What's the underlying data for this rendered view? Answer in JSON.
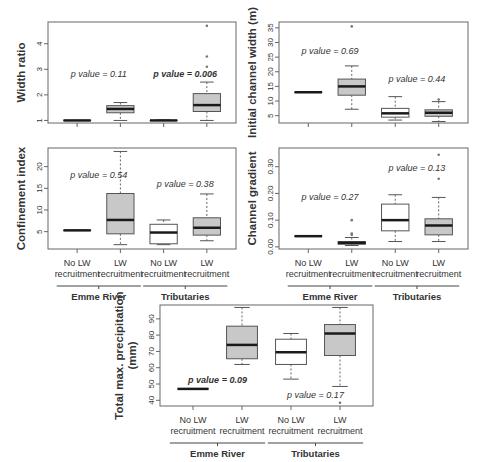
{
  "figure": {
    "group_labels": [
      "No LW\nrecruitment",
      "LW\nrecruitment",
      "No LW\nrecruitment",
      "LW\nrecruitment"
    ],
    "site_labels": [
      "Emme River",
      "Tributaries"
    ]
  },
  "chart_data": [
    {
      "type": "boxplot",
      "id": "width_ratio",
      "ylabel": "Width ratio",
      "yticks": [
        1,
        2,
        3,
        4
      ],
      "ylim": [
        0.9,
        4.85
      ],
      "categories": [
        "Emme River – No LW recruitment",
        "Emme River – LW recruitment",
        "Tributaries – No LW recruitment",
        "Tributaries – LW recruitment"
      ],
      "boxes": [
        {
          "min": 1.0,
          "q1": 1.0,
          "median": 1.0,
          "q3": 1.0,
          "max": 1.0,
          "fill": "#ffffff",
          "outliers": []
        },
        {
          "min": 1.0,
          "q1": 1.3,
          "median": 1.45,
          "q3": 1.58,
          "max": 1.7,
          "fill": "#c8c8c8",
          "outliers": []
        },
        {
          "min": 1.0,
          "q1": 1.0,
          "median": 1.0,
          "q3": 1.0,
          "max": 1.02,
          "fill": "#ffffff",
          "outliers": []
        },
        {
          "min": 1.0,
          "q1": 1.35,
          "median": 1.6,
          "q3": 2.05,
          "max": 2.5,
          "fill": "#c8c8c8",
          "outliers": [
            3.1,
            3.5,
            4.7
          ]
        }
      ],
      "annotations": [
        {
          "text": "p value = 0.11",
          "bold": false,
          "x_group": 1.5,
          "y": 2.7
        },
        {
          "text": "p value = 0.006",
          "bold": true,
          "x_group": 3.5,
          "y": 2.7
        }
      ]
    },
    {
      "type": "boxplot",
      "id": "initial_channel_width",
      "ylabel": "Initial channel width (m)",
      "yticks": [
        5,
        10,
        15,
        20,
        25,
        30,
        35
      ],
      "ylim": [
        2.5,
        37
      ],
      "categories": [
        "Emme River – No LW recruitment",
        "Emme River – LW recruitment",
        "Tributaries – No LW recruitment",
        "Tributaries – LW recruitment"
      ],
      "boxes": [
        {
          "min": 13,
          "q1": 13,
          "median": 13,
          "q3": 13,
          "max": 13,
          "fill": "#ffffff",
          "outliers": []
        },
        {
          "min": 7.2,
          "q1": 12,
          "median": 15,
          "q3": 17.5,
          "max": 22,
          "fill": "#c8c8c8",
          "outliers": [
            35.5
          ]
        },
        {
          "min": 3.5,
          "q1": 4.5,
          "median": 5.8,
          "q3": 7.5,
          "max": 11.5,
          "fill": "#ffffff",
          "outliers": []
        },
        {
          "min": 3.0,
          "q1": 4.8,
          "median": 6.0,
          "q3": 7.0,
          "max": 9.8,
          "fill": "#c8c8c8",
          "outliers": [
            10.5
          ]
        }
      ],
      "annotations": [
        {
          "text": "p value = 0.69",
          "bold": false,
          "x_group": 1.5,
          "y": 26.2
        },
        {
          "text": "p value = 0.44",
          "bold": false,
          "x_group": 3.5,
          "y": 16.5
        }
      ]
    },
    {
      "type": "boxplot",
      "id": "confinement_index",
      "ylabel": "Confinement index",
      "yticks": [
        5,
        10,
        15,
        20
      ],
      "ylim": [
        1.0,
        24.3
      ],
      "categories": [
        "Emme River – No LW recruitment",
        "Emme River – LW recruitment",
        "Tributaries – No LW recruitment",
        "Tributaries – LW recruitment"
      ],
      "boxes": [
        {
          "min": 5.3,
          "q1": 5.3,
          "median": 5.3,
          "q3": 5.3,
          "max": 5.3,
          "fill": "#ffffff",
          "outliers": []
        },
        {
          "min": 2.0,
          "q1": 4.5,
          "median": 7.7,
          "q3": 13.8,
          "max": 23.5,
          "fill": "#c8c8c8",
          "outliers": []
        },
        {
          "min": 2.0,
          "q1": 2.2,
          "median": 4.8,
          "q3": 6.7,
          "max": 7.7,
          "fill": "#ffffff",
          "outliers": []
        },
        {
          "min": 2.9,
          "q1": 4.2,
          "median": 5.9,
          "q3": 8.2,
          "max": 13.7,
          "fill": "#c8c8c8",
          "outliers": []
        }
      ],
      "annotations": [
        {
          "text": "p value = 0.54",
          "bold": false,
          "x_group": 1.5,
          "y": 17.4
        },
        {
          "text": "p value = 0.38",
          "bold": false,
          "x_group": 3.5,
          "y": 15.3
        }
      ]
    },
    {
      "type": "boxplot",
      "id": "channel_gradient",
      "ylabel": "Channel gradient",
      "yticks": [
        0.0,
        0.1,
        0.2,
        0.3
      ],
      "ytick_labels": [
        "0.00",
        "0.10",
        "0.20",
        "0.30"
      ],
      "ylim": [
        -0.008,
        0.37
      ],
      "categories": [
        "Emme River – No LW recruitment",
        "Emme River – LW recruitment",
        "Tributaries – No LW recruitment",
        "Tributaries – LW recruitment"
      ],
      "boxes": [
        {
          "min": 0.04,
          "q1": 0.04,
          "median": 0.04,
          "q3": 0.04,
          "max": 0.04,
          "fill": "#ffffff",
          "outliers": []
        },
        {
          "min": 0.005,
          "q1": 0.01,
          "median": 0.015,
          "q3": 0.02,
          "max": 0.035,
          "fill": "#c8c8c8",
          "outliers": [
            0.045,
            0.05,
            0.1
          ]
        },
        {
          "min": 0.02,
          "q1": 0.06,
          "median": 0.1,
          "q3": 0.16,
          "max": 0.195,
          "fill": "#ffffff",
          "outliers": []
        },
        {
          "min": 0.02,
          "q1": 0.045,
          "median": 0.08,
          "q3": 0.105,
          "max": 0.185,
          "fill": "#c8c8c8",
          "outliers": [
            0.255,
            0.345
          ]
        }
      ],
      "annotations": [
        {
          "text": "p value = 0.27",
          "bold": false,
          "x_group": 1.5,
          "y": 0.175
        },
        {
          "text": "p value = 0.13",
          "bold": false,
          "x_group": 3.5,
          "y": 0.285
        }
      ]
    },
    {
      "type": "boxplot",
      "id": "total_max_precipitation",
      "ylabel": "Total max. precipitation\n(mm)",
      "yticks": [
        40,
        50,
        60,
        70,
        80,
        90
      ],
      "ylim": [
        36.5,
        98.5
      ],
      "categories": [
        "Emme River – No LW recruitment",
        "Emme River – LW recruitment",
        "Tributaries – No LW recruitment",
        "Tributaries – LW recruitment"
      ],
      "boxes": [
        {
          "min": 47,
          "q1": 47,
          "median": 47,
          "q3": 47,
          "max": 47,
          "fill": "#ffffff",
          "outliers": []
        },
        {
          "min": 62,
          "q1": 65.5,
          "median": 74,
          "q3": 85.5,
          "max": 97,
          "fill": "#c8c8c8",
          "outliers": []
        },
        {
          "min": 53,
          "q1": 62,
          "median": 69.5,
          "q3": 77.5,
          "max": 81,
          "fill": "#ffffff",
          "outliers": []
        },
        {
          "min": 48.5,
          "q1": 67.5,
          "median": 81,
          "q3": 86.5,
          "max": 97,
          "fill": "#c8c8c8",
          "outliers": [
            38.5
          ]
        }
      ],
      "annotations": [
        {
          "text": "p value = 0.09",
          "bold": true,
          "x_group": 1.5,
          "y": 50.5
        },
        {
          "text": "p value = 0.17",
          "bold": false,
          "x_group": 3.5,
          "y": 41.5
        }
      ]
    }
  ],
  "colors": {
    "lw_fill": "#c8c8c8",
    "no_lw_fill": "#ffffff",
    "axis": "#555555",
    "median": "#1a1a1a"
  }
}
